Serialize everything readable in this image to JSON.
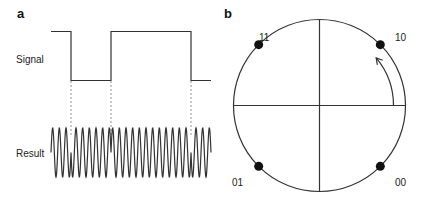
{
  "panel_a": {
    "label": "a",
    "signal_label": "Signal",
    "result_label": "Result",
    "signal_levels": [
      1,
      0,
      1,
      0
    ],
    "signal_transitions_fraction": [
      0.125,
      0.375,
      0.875
    ],
    "result_cycles": 24
  },
  "panel_b": {
    "label": "b",
    "states": [
      {
        "label": "11",
        "angle_deg": 135
      },
      {
        "label": "10",
        "angle_deg": 45
      },
      {
        "label": "01",
        "angle_deg": 225
      },
      {
        "label": "00",
        "angle_deg": 315
      }
    ],
    "arrow": {
      "from_deg": 0,
      "to_deg": 40
    }
  },
  "colors": {
    "line": "#333333",
    "dot": "#111111",
    "dash": "#777777"
  }
}
